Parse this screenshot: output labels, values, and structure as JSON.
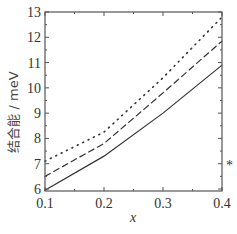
{
  "chart_data": {
    "type": "line",
    "title": "",
    "xlabel": "x",
    "ylabel": "结合能 / meV",
    "xlim": [
      0.1,
      0.4
    ],
    "ylim": [
      6,
      13
    ],
    "xticks": [
      0.1,
      0.2,
      0.3,
      0.4
    ],
    "xtick_labels": [
      "0.1",
      "0.2",
      "0.3",
      "0.4"
    ],
    "yticks": [
      6,
      7,
      8,
      9,
      10,
      11,
      12,
      13
    ],
    "ytick_labels": [
      "6",
      "7",
      "8",
      "9",
      "10",
      "11",
      "12",
      "13"
    ],
    "grid": false,
    "legend": null,
    "x": [
      0.1,
      0.2,
      0.3,
      0.4
    ],
    "series": [
      {
        "name": "solid",
        "style": "solid",
        "values": [
          5.95,
          7.3,
          9.0,
          10.9
        ]
      },
      {
        "name": "dashed",
        "style": "dashed",
        "values": [
          6.5,
          7.8,
          9.8,
          11.85
        ]
      },
      {
        "name": "dotted",
        "style": "dotted",
        "values": [
          7.1,
          8.25,
          10.4,
          12.8
        ]
      }
    ],
    "annotations": [
      {
        "text": "*",
        "x": 0.41,
        "y": 7
      }
    ]
  }
}
